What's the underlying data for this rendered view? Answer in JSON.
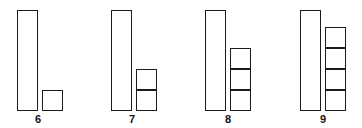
{
  "figure": {
    "type": "base-ten-block-diagram",
    "background_color": "#ffffff",
    "stroke_color": "#1c1c1c",
    "fill_color": "#ffffff",
    "baseline_y": 111,
    "rod_top_y": 10,
    "rod_width": 21,
    "rod_height": 101,
    "unit_size": 21,
    "rod_value": 10,
    "unit_value": 1
  },
  "chart_data": {
    "type": "bar",
    "title": "",
    "subtitle": "",
    "xlabel": "",
    "ylabel": "",
    "categories": [
      "6",
      "7",
      "8",
      "9"
    ],
    "values": [
      11,
      12,
      13,
      14
    ],
    "series": [
      {
        "name": "tens rod",
        "values": [
          1,
          1,
          1,
          1
        ]
      },
      {
        "name": "unit cubes",
        "values": [
          1,
          2,
          3,
          4
        ]
      }
    ],
    "ylim": [
      0,
      14
    ],
    "grid": false,
    "legend": "none",
    "annotations": [
      "6",
      "7",
      "8",
      "9"
    ]
  },
  "groups": [
    {
      "id": "group-6",
      "label": "6",
      "label_x": 28,
      "label_y": 113,
      "rod": {
        "x": 17,
        "y": 10,
        "w": 21,
        "h": 101
      },
      "units": {
        "x": 42,
        "count": 1,
        "size": 21
      }
    },
    {
      "id": "group-7",
      "label": "7",
      "label_x": 122,
      "label_y": 113,
      "rod": {
        "x": 111,
        "y": 10,
        "w": 21,
        "h": 101
      },
      "units": {
        "x": 136,
        "count": 2,
        "size": 21
      }
    },
    {
      "id": "group-8",
      "label": "8",
      "label_x": 218,
      "label_y": 113,
      "rod": {
        "x": 205,
        "y": 10,
        "w": 21,
        "h": 101
      },
      "units": {
        "x": 230,
        "count": 3,
        "size": 21
      }
    },
    {
      "id": "group-9",
      "label": "9",
      "label_x": 313,
      "label_y": 113,
      "rod": {
        "x": 300,
        "y": 10,
        "w": 21,
        "h": 101
      },
      "units": {
        "x": 325,
        "count": 4,
        "size": 21
      }
    }
  ]
}
